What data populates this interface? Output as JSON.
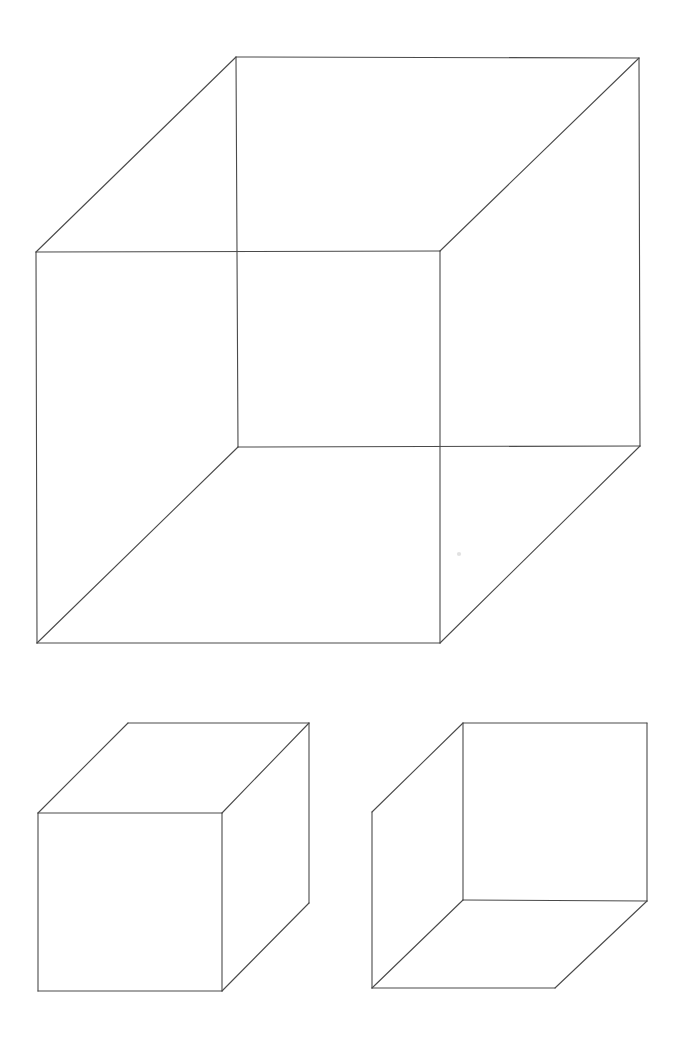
{
  "page": {
    "background_color": "#ffffff",
    "width": 693,
    "height": 1052
  },
  "style": {
    "line_color": "#4a4a4a",
    "line_color_dark": "#3c3c3c",
    "line_width": 1.1,
    "smudge_color": "#c9c9c9"
  },
  "figures": [
    {
      "id": "necker-cube-large",
      "label": "Large ambiguous Necker cube",
      "kind": "wireframe-cube",
      "description": "Transparent wireframe cube: two overlapping squares joined at corners; both interpretations possible.",
      "vertices": {
        "front_top_left": [
          36,
          252
        ],
        "front_top_right": [
          440,
          251
        ],
        "front_bottom_right": [
          440,
          643
        ],
        "front_bottom_left": [
          37,
          643
        ],
        "back_top_left": [
          236,
          57
        ],
        "back_top_right": [
          639,
          58
        ],
        "back_bottom_right": [
          640,
          446
        ],
        "back_bottom_left": [
          238,
          447
        ]
      },
      "edges": [
        [
          "front_top_left",
          "front_top_right"
        ],
        [
          "front_top_right",
          "front_bottom_right"
        ],
        [
          "front_bottom_right",
          "front_bottom_left"
        ],
        [
          "front_bottom_left",
          "front_top_left"
        ],
        [
          "back_top_left",
          "back_top_right"
        ],
        [
          "back_top_right",
          "back_bottom_right"
        ],
        [
          "back_bottom_right",
          "back_bottom_left"
        ],
        [
          "back_bottom_left",
          "back_top_left"
        ],
        [
          "front_top_left",
          "back_top_left"
        ],
        [
          "front_top_right",
          "back_top_right"
        ],
        [
          "front_bottom_right",
          "back_bottom_right"
        ],
        [
          "front_bottom_left",
          "back_bottom_left"
        ]
      ]
    },
    {
      "id": "cube-solid-left",
      "label": "Solid cube seen from outside (lower-left front face)",
      "kind": "opaque-cube",
      "description": "Opaque cube; front face at lower left, top face and right face visible, hidden edges omitted.",
      "vertices": {
        "front_top_left": [
          38,
          813
        ],
        "front_top_right": [
          222,
          813
        ],
        "front_bottom_right": [
          222,
          991
        ],
        "front_bottom_left": [
          38,
          991
        ],
        "back_top_left": [
          128,
          723
        ],
        "back_top_right": [
          309,
          723
        ],
        "back_bottom_right": [
          309,
          903
        ]
      },
      "edges": [
        [
          "front_top_left",
          "front_top_right"
        ],
        [
          "front_top_right",
          "front_bottom_right"
        ],
        [
          "front_bottom_right",
          "front_bottom_left"
        ],
        [
          "front_bottom_left",
          "front_top_left"
        ],
        [
          "front_top_left",
          "back_top_left"
        ],
        [
          "back_top_left",
          "back_top_right"
        ],
        [
          "front_top_right",
          "back_top_right"
        ],
        [
          "back_top_right",
          "back_bottom_right"
        ],
        [
          "front_bottom_right",
          "back_bottom_right"
        ]
      ]
    },
    {
      "id": "cube-hollow-right",
      "label": "Hollow box seen from inside (upper-right back face)",
      "kind": "inverted-cube",
      "description": "Box interior; back face at upper right, left inner wall and bottom inner floor visible, hidden edges omitted.",
      "vertices": {
        "back_top_left": [
          463,
          723
        ],
        "back_top_right": [
          647,
          723
        ],
        "back_bottom_right": [
          647,
          901
        ],
        "back_bottom_left": [
          463,
          900
        ],
        "front_top_left": [
          372,
          812
        ],
        "front_bottom_left": [
          372,
          988
        ],
        "front_bottom_right": [
          555,
          988
        ]
      },
      "edges": [
        [
          "back_top_left",
          "back_top_right"
        ],
        [
          "back_top_right",
          "back_bottom_right"
        ],
        [
          "back_bottom_right",
          "back_bottom_left"
        ],
        [
          "back_bottom_left",
          "back_top_left"
        ],
        [
          "back_top_left",
          "front_top_left"
        ],
        [
          "front_top_left",
          "front_bottom_left"
        ],
        [
          "back_bottom_left",
          "front_bottom_left"
        ],
        [
          "front_bottom_left",
          "front_bottom_right"
        ],
        [
          "back_bottom_right",
          "front_bottom_right"
        ]
      ]
    }
  ],
  "marks": [
    {
      "id": "pencil-smudge",
      "x": 459,
      "y": 554,
      "r": 2.1
    }
  ]
}
